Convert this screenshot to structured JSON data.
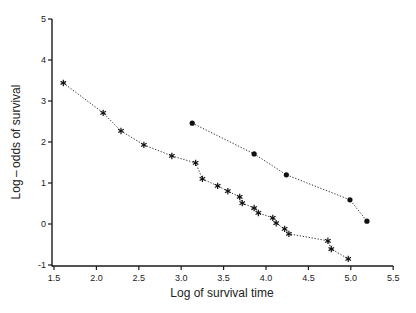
{
  "chart_data": {
    "type": "line",
    "title": "",
    "xlabel": "Log of survival time",
    "ylabel": "Log – odds of survival",
    "xlim": [
      1.5,
      5.5
    ],
    "ylim": [
      -1,
      5
    ],
    "xticks": [
      "1.5",
      "2.0",
      "2.5",
      "3.0",
      "3.5",
      "4.0",
      "4.5",
      "5.0",
      "5.5"
    ],
    "yticks": [
      "-1",
      "0",
      "1",
      "2",
      "3",
      "4",
      "5"
    ],
    "grid": false,
    "legend": null,
    "series": [
      {
        "name": "series-star",
        "marker": "star",
        "line": "dotted",
        "x": [
          1.61,
          2.08,
          2.29,
          2.56,
          2.89,
          3.17,
          3.25,
          3.43,
          3.55,
          3.69,
          3.72,
          3.86,
          3.91,
          4.08,
          4.12,
          4.22,
          4.27,
          4.73,
          4.77,
          4.97
        ],
        "y": [
          3.44,
          2.71,
          2.27,
          1.93,
          1.66,
          1.49,
          1.1,
          0.93,
          0.8,
          0.66,
          0.51,
          0.39,
          0.27,
          0.15,
          0.02,
          -0.12,
          -0.24,
          -0.41,
          -0.61,
          -0.85
        ]
      },
      {
        "name": "series-dot",
        "marker": "circle",
        "line": "dotted",
        "x": [
          3.13,
          3.86,
          4.24,
          4.99,
          5.19
        ],
        "y": [
          2.46,
          1.71,
          1.2,
          0.59,
          0.07
        ]
      }
    ]
  }
}
